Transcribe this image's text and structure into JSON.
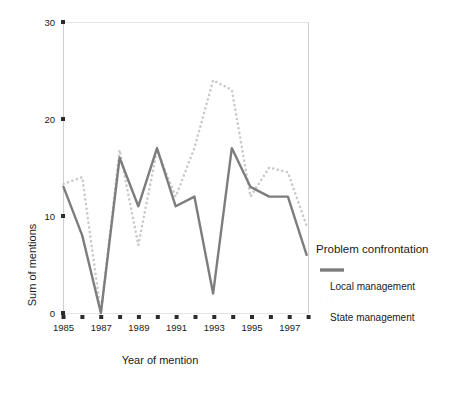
{
  "chart_data": {
    "type": "line",
    "title": "",
    "xlabel": "Year of mention",
    "ylabel": "Sum of mentions",
    "xlim": [
      1985,
      1998
    ],
    "ylim": [
      0,
      30
    ],
    "grid": false,
    "legend_position": "right",
    "legend_title": "Problem confrontation",
    "x": [
      1985,
      1986,
      1987,
      1988,
      1989,
      1990,
      1991,
      1992,
      1993,
      1994,
      1995,
      1996,
      1997,
      1998
    ],
    "xticks": [
      1985,
      1986,
      1987,
      1988,
      1989,
      1990,
      1991,
      1992,
      1993,
      1994,
      1995,
      1996,
      1997,
      1998
    ],
    "xticklabels": [
      "1985",
      "",
      "1987",
      "",
      "1989",
      "",
      "1991",
      "",
      "1993",
      "",
      "1995",
      "",
      "1997",
      ""
    ],
    "xticklabels_visible": [
      "1985",
      "1987",
      "1989",
      "1991",
      "1993",
      "1995",
      "1997"
    ],
    "yticks": [
      0,
      10,
      20,
      30
    ],
    "yticklabels": [
      "0",
      "10",
      "20",
      "30"
    ],
    "series": [
      {
        "name": "Local management",
        "style": "solid",
        "color": "#7d7d7d",
        "values": [
          13,
          8,
          0,
          16,
          11,
          17,
          11,
          12,
          2,
          17,
          13,
          12,
          12,
          6
        ]
      },
      {
        "name": "State management",
        "style": "dotted",
        "color": "#c9c9c9",
        "values": [
          13.3,
          14,
          0,
          16.8,
          7,
          16.8,
          12,
          17,
          24,
          23,
          12,
          15,
          14.5,
          9
        ]
      }
    ]
  },
  "axes": {
    "y_axis_title": "Sum of mentions",
    "x_axis_title": "Year of mention",
    "y_tick_labels": [
      "0",
      "10",
      "20",
      "30"
    ],
    "x_tick_labels": [
      "1985",
      "1987",
      "1989",
      "1991",
      "1993",
      "1995",
      "1997"
    ]
  },
  "legend": {
    "title": "Problem confrontation",
    "entries": [
      {
        "label": "Local management",
        "swatch": "solid-line-swatch"
      },
      {
        "label": "State management",
        "swatch": "dotted-line-swatch"
      }
    ]
  },
  "colors": {
    "solid_series": "#7d7d7d",
    "dotted_series": "#c9c9c9",
    "axis": "#c4c4c4",
    "text": "#1a1a1a",
    "tick_marker": "#2b2b2b",
    "background": "#ffffff"
  }
}
